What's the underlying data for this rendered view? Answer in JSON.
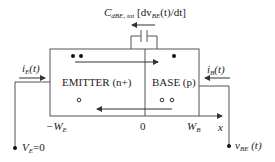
{
  "capacitor_label": {
    "main": "C",
    "sub": "dBE, tot",
    "rest_open": " [dv",
    "rest_sub": "BE",
    "rest_close": "(t)/dt]"
  },
  "emitter_label": "EMITTER (n+)",
  "base_label": "BASE (p)",
  "ie_label": {
    "main": "i",
    "sub": "E",
    "rest": "(t)"
  },
  "ib_label": {
    "main": "i",
    "sub": "B",
    "rest": "(t)"
  },
  "axis": {
    "left": {
      "main": "−W",
      "sub": "E"
    },
    "zero": "0",
    "right": {
      "main": "W",
      "sub": "B"
    },
    "x": "x"
  },
  "ve_label": {
    "main": "V",
    "sub": "E",
    "rest": "=0"
  },
  "vbe_label": {
    "main": "v",
    "sub": "BE",
    "rest": " (t)"
  },
  "colors": {
    "line": "#555555",
    "dot": "#111111"
  }
}
